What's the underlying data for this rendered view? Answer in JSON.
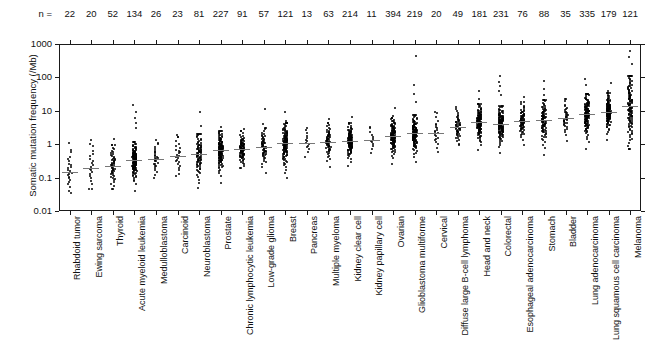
{
  "chart_data": {
    "type": "scatter",
    "title": "",
    "xlabel": "",
    "ylabel": "Somatic mutation frequency (/Mb)",
    "yscale": "log",
    "ylim": [
      0.01,
      1000
    ],
    "ytick_labels": [
      "1000",
      "100",
      "10",
      "1",
      "0.1",
      "0.01"
    ],
    "ytick_values": [
      1000,
      100,
      10,
      1,
      0.1,
      0.01
    ],
    "n_prefix": "n =",
    "grid": false,
    "legend": "none",
    "median_marker": "horizontal tick",
    "categories": [
      "Rhabdoid tumor",
      "Ewing sarcoma",
      "Thyroid",
      "Acute myeloid leukemia",
      "Medulloblastoma",
      "Carcinoid",
      "Neuroblastoma",
      "Prostate",
      "Chronic lymphocytic leukemia",
      "Low-grade glioma",
      "Breast",
      "Pancreas",
      "Multiple myeloma",
      "Kidney clear cell",
      "Kidney papillary cell",
      "Ovarian",
      "Glioblastoma multiforme",
      "Cervical",
      "Diffuse large B-cell lymphoma",
      "Head and neck",
      "Colorectal",
      "Esophageal adenocarcinoma",
      "Stomach",
      "Bladder",
      "Lung adenocarcinoma",
      "Lung squamous cell carcinoma",
      "Melanoma"
    ],
    "n_values": [
      22,
      20,
      52,
      134,
      26,
      23,
      81,
      227,
      91,
      57,
      121,
      13,
      63,
      214,
      11,
      394,
      219,
      20,
      49,
      181,
      231,
      76,
      88,
      35,
      335,
      179,
      121
    ],
    "series": [
      {
        "name": "Rhabdoid tumor",
        "n": 22,
        "median": 0.15,
        "min": 0.035,
        "max": 1.1,
        "q1": 0.09,
        "q3": 0.28,
        "outliers_high": [
          1.1
        ]
      },
      {
        "name": "Ewing sarcoma",
        "n": 20,
        "median": 0.2,
        "min": 0.045,
        "max": 1.3,
        "q1": 0.11,
        "q3": 0.42,
        "outliers_high": [
          1.3
        ]
      },
      {
        "name": "Thyroid",
        "n": 52,
        "median": 0.23,
        "min": 0.045,
        "max": 1.4,
        "q1": 0.14,
        "q3": 0.4,
        "outliers_high": [
          1.4
        ]
      },
      {
        "name": "Acute myeloid leukemia",
        "n": 134,
        "median": 0.33,
        "min": 0.04,
        "max": 15.0,
        "q1": 0.22,
        "q3": 0.5,
        "outliers_high": [
          15.0,
          9.0,
          6.0,
          4.2,
          3.0
        ]
      },
      {
        "name": "Medulloblastoma",
        "n": 26,
        "median": 0.35,
        "min": 0.1,
        "max": 1.1,
        "q1": 0.24,
        "q3": 0.55,
        "outliers_high": [
          1.1
        ]
      },
      {
        "name": "Carcinoid",
        "n": 23,
        "median": 0.45,
        "min": 0.11,
        "max": 1.7,
        "q1": 0.28,
        "q3": 0.8,
        "outliers_high": [
          1.7
        ]
      },
      {
        "name": "Neuroblastoma",
        "n": 81,
        "median": 0.5,
        "min": 0.05,
        "max": 9.0,
        "q1": 0.28,
        "q3": 0.85,
        "outliers_high": [
          9.0,
          3.5
        ]
      },
      {
        "name": "Prostate",
        "n": 227,
        "median": 0.65,
        "min": 0.06,
        "max": 3.2,
        "q1": 0.42,
        "q3": 1.0,
        "outliers_high": [
          3.2
        ]
      },
      {
        "name": "Chronic lymphocytic leukemia",
        "n": 91,
        "median": 0.7,
        "min": 0.2,
        "max": 2.8,
        "q1": 0.5,
        "q3": 1.0,
        "outliers_high": [
          2.8
        ]
      },
      {
        "name": "Low-grade glioma",
        "n": 57,
        "median": 0.85,
        "min": 0.13,
        "max": 11.0,
        "q1": 0.55,
        "q3": 1.3,
        "outliers_high": [
          11.0,
          4.0
        ]
      },
      {
        "name": "Breast",
        "n": 121,
        "median": 1.05,
        "min": 0.1,
        "max": 9.0,
        "q1": 0.65,
        "q3": 1.8,
        "outliers_high": [
          9.0,
          5.0
        ]
      },
      {
        "name": "Pancreas",
        "n": 13,
        "median": 1.1,
        "min": 0.38,
        "max": 2.6,
        "q1": 0.8,
        "q3": 1.6,
        "outliers_high": [
          2.6
        ]
      },
      {
        "name": "Multiple myeloma",
        "n": 63,
        "median": 1.2,
        "min": 0.16,
        "max": 5.5,
        "q1": 0.8,
        "q3": 1.8,
        "outliers_high": [
          5.5
        ]
      },
      {
        "name": "Kidney clear cell",
        "n": 214,
        "median": 1.25,
        "min": 0.2,
        "max": 6.5,
        "q1": 0.9,
        "q3": 1.8,
        "outliers_high": [
          6.5
        ]
      },
      {
        "name": "Kidney papillary cell",
        "n": 11,
        "median": 1.3,
        "min": 0.55,
        "max": 3.0,
        "q1": 0.95,
        "q3": 1.9,
        "outliers_high": [
          3.0
        ]
      },
      {
        "name": "Ovarian",
        "n": 394,
        "median": 1.8,
        "min": 0.16,
        "max": 12.0,
        "q1": 1.2,
        "q3": 2.6,
        "outliers_high": [
          12.0,
          7.0
        ]
      },
      {
        "name": "Glioblastoma multiforme",
        "n": 219,
        "median": 2.1,
        "min": 0.25,
        "max": 450.0,
        "q1": 1.4,
        "q3": 3.1,
        "outliers_high": [
          450.0,
          60.0,
          32.0,
          18.0
        ]
      },
      {
        "name": "Cervical",
        "n": 20,
        "median": 2.2,
        "min": 0.6,
        "max": 9.0,
        "q1": 1.4,
        "q3": 3.5,
        "outliers_high": [
          9.0
        ]
      },
      {
        "name": "Diffuse large B-cell lymphoma",
        "n": 49,
        "median": 3.2,
        "min": 0.95,
        "max": 13.0,
        "q1": 2.2,
        "q3": 4.6,
        "outliers_high": [
          13.0
        ]
      },
      {
        "name": "Head and neck",
        "n": 181,
        "median": 4.5,
        "min": 0.3,
        "max": 40.0,
        "q1": 3.0,
        "q3": 6.5,
        "outliers_high": [
          40.0,
          22.0
        ]
      },
      {
        "name": "Colorectal",
        "n": 231,
        "median": 4.0,
        "min": 0.3,
        "max": 110.0,
        "q1": 2.7,
        "q3": 6.0,
        "outliers_high": [
          110.0,
          75.0,
          55.0,
          40.0,
          30.0
        ]
      },
      {
        "name": "Esophageal adenocarcinoma",
        "n": 76,
        "median": 5.0,
        "min": 0.8,
        "max": 26.0,
        "q1": 3.6,
        "q3": 7.5,
        "outliers_high": [
          26.0
        ]
      },
      {
        "name": "Stomach",
        "n": 88,
        "median": 5.2,
        "min": 0.3,
        "max": 80.0,
        "q1": 3.2,
        "q3": 9.0,
        "outliers_high": [
          80.0,
          45.0,
          30.0
        ]
      },
      {
        "name": "Bladder",
        "n": 35,
        "median": 6.0,
        "min": 0.6,
        "max": 22.0,
        "q1": 4.2,
        "q3": 9.5,
        "outliers_high": [
          22.0
        ]
      },
      {
        "name": "Lung adenocarcinoma",
        "n": 335,
        "median": 8.0,
        "min": 0.12,
        "max": 90.0,
        "q1": 5.0,
        "q3": 13.0,
        "outliers_high": [
          90.0,
          60.0
        ]
      },
      {
        "name": "Lung squamous cell carcinoma",
        "n": 179,
        "median": 9.5,
        "min": 0.12,
        "max": 70.0,
        "q1": 6.5,
        "q3": 14.0,
        "outliers_high": [
          70.0,
          40.0
        ]
      },
      {
        "name": "Melanoma",
        "n": 121,
        "median": 14.0,
        "min": 0.7,
        "max": 600.0,
        "q1": 8.0,
        "q3": 45.0,
        "outliers_high": [
          600.0,
          400.0,
          250.0
        ]
      }
    ]
  }
}
